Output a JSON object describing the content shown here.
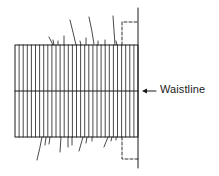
{
  "diagram": {
    "type": "sewing-pattern",
    "labels": {
      "waistline": "Waistline"
    },
    "colors": {
      "line": "#1a1a1a",
      "background": "#ffffff"
    },
    "panel": {
      "x": 15,
      "y": 45,
      "width": 123,
      "height": 92,
      "stripe_count": 30,
      "waistline_y": 91
    },
    "edge_line": {
      "x": 138,
      "y_top": 8,
      "y_bottom": 168
    },
    "dashed_tabs": [
      {
        "position": "top",
        "x_left": 122,
        "y_outer": 22
      },
      {
        "position": "bottom",
        "x_left": 122,
        "y_outer": 159
      }
    ],
    "arrow": {
      "direction": "left",
      "from_x": 156,
      "to_x": 142,
      "y": 91
    }
  }
}
